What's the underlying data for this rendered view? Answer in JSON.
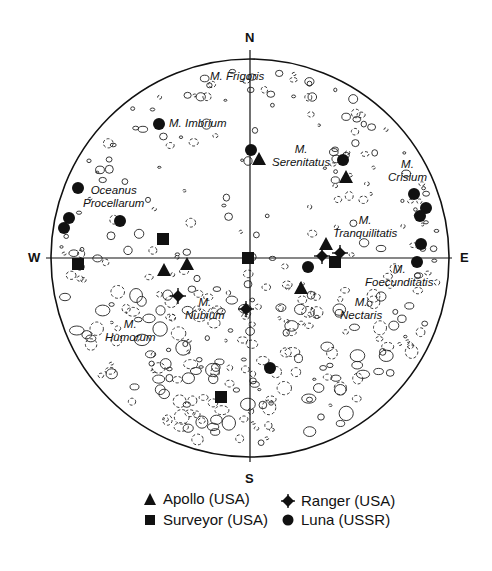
{
  "figure": {
    "title": "",
    "compass": {
      "north": "N",
      "south": "S",
      "west": "W",
      "east": "E"
    },
    "maria": [
      {
        "id": "frigoris",
        "line1": "M. Frigoris",
        "line2": "",
        "x": 210,
        "y": 70
      },
      {
        "id": "imbrium",
        "line1": "M. Imbrium",
        "line2": "",
        "x": 169,
        "y": 117
      },
      {
        "id": "serenitatus",
        "line1": "M.",
        "line2": "Serenitatus",
        "x": 272,
        "y": 143
      },
      {
        "id": "crisium",
        "line1": "M.",
        "line2": "Crisium",
        "x": 388,
        "y": 158
      },
      {
        "id": "oceanus",
        "line1": "Oceanus",
        "line2": "Procellarum",
        "x": 83,
        "y": 184
      },
      {
        "id": "tranquilitatis",
        "line1": "M.",
        "line2": "Tranquilitatis",
        "x": 333,
        "y": 214
      },
      {
        "id": "foecunditatis",
        "line1": "M.",
        "line2": "Foecunditatis",
        "x": 365,
        "y": 263
      },
      {
        "id": "nectaris",
        "line1": "M.",
        "line2": "Nectaris",
        "x": 340,
        "y": 296
      },
      {
        "id": "nubium",
        "line1": "M.",
        "line2": "Nubium",
        "x": 185,
        "y": 296
      },
      {
        "id": "humorum",
        "line1": "M.",
        "line2": "Humorum",
        "x": 105,
        "y": 318
      }
    ],
    "legend": {
      "apollo": "Apollo (USA)",
      "surveyor": "Surveyor (USA)",
      "ranger": "Ranger (USA)",
      "luna": "Luna (USSR)"
    },
    "colors": {
      "ink": "#111111",
      "background": "#ffffff"
    }
  },
  "chart_data": {
    "type": "scatter",
    "xlabel": "W — E",
    "ylabel": "S — N",
    "legend_position": "bottom",
    "grid": false,
    "series": [
      {
        "name": "Apollo (USA)",
        "marker": "triangle",
        "points": [
          [
            259,
            159
          ],
          [
            346,
            177
          ],
          [
            326,
            244
          ],
          [
            164,
            270
          ],
          [
            187,
            264
          ],
          [
            301,
            288
          ]
        ]
      },
      {
        "name": "Surveyor (USA)",
        "marker": "square",
        "points": [
          [
            163,
            239
          ],
          [
            78,
            264
          ],
          [
            248,
            258
          ],
          [
            335,
            262
          ],
          [
            221,
            397
          ]
        ]
      },
      {
        "name": "Ranger (USA)",
        "marker": "diamond-cross",
        "points": [
          [
            178,
            296
          ],
          [
            246,
            309
          ],
          [
            322,
            256
          ],
          [
            340,
            253
          ]
        ]
      },
      {
        "name": "Luna (USSR)",
        "marker": "circle",
        "points": [
          [
            159,
            124
          ],
          [
            251,
            150
          ],
          [
            343,
            160
          ],
          [
            78,
            188
          ],
          [
            69,
            218
          ],
          [
            64,
            228
          ],
          [
            120,
            221
          ],
          [
            414,
            194
          ],
          [
            426,
            208
          ],
          [
            420,
            216
          ],
          [
            421,
            244
          ],
          [
            417,
            262
          ],
          [
            308,
            267
          ],
          [
            270,
            368
          ]
        ]
      }
    ]
  }
}
